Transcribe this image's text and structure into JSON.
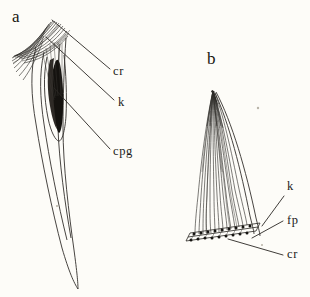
{
  "figure": {
    "background_color": "#fdfcf8",
    "ink_color": "#1c1a18",
    "panels": [
      {
        "id": "a",
        "panel_label": "a",
        "label_x": 12,
        "label_y": 22,
        "description": "elongated tapering curved spine with dorsal fiber bundle and dark inner core",
        "callouts": [
          {
            "key": "cr",
            "text": "cr",
            "label_x": 113,
            "label_y": 75,
            "leader_from_x": 52,
            "leader_from_y": 20,
            "leader_to_x": 110,
            "leader_to_y": 69
          },
          {
            "key": "k",
            "text": "k",
            "label_x": 118,
            "label_y": 106,
            "leader_from_x": 46,
            "leader_from_y": 37,
            "leader_to_x": 114,
            "leader_to_y": 100
          },
          {
            "key": "cpg",
            "text": "cpg",
            "label_x": 113,
            "label_y": 155,
            "leader_from_x": 54,
            "leader_from_y": 88,
            "leader_to_x": 110,
            "leader_to_y": 149
          }
        ]
      },
      {
        "id": "b",
        "panel_label": "b",
        "label_x": 207,
        "label_y": 64,
        "description": "curved pointed fiber bundle rising from a basal plate with attachment points",
        "callouts": [
          {
            "key": "k",
            "text": "k",
            "label_x": 287,
            "label_y": 190,
            "leader_from_x": 262,
            "leader_from_y": 226,
            "leader_to_x": 284,
            "leader_to_y": 196
          },
          {
            "key": "fp",
            "text": "fp",
            "label_x": 287,
            "label_y": 224,
            "leader_from_x": 252,
            "leader_from_y": 238,
            "leader_to_x": 283,
            "leader_to_y": 221
          },
          {
            "key": "cr",
            "text": "cr",
            "label_x": 287,
            "label_y": 258,
            "leader_from_x": 228,
            "leader_from_y": 239,
            "leader_to_x": 283,
            "leader_to_y": 255
          }
        ]
      }
    ],
    "abbreviations": [
      "cr",
      "k",
      "cpg",
      "fp"
    ]
  }
}
